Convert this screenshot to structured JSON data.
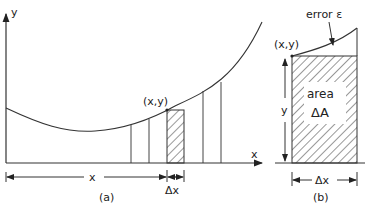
{
  "figure": {
    "panel_a": {
      "caption": "(a)",
      "axis_y_label": "y",
      "axis_x_label": "x",
      "point_label": "(x,y)",
      "width_label": "Δx",
      "distance_label": "x"
    },
    "panel_b": {
      "caption": "(b)",
      "error_label": "error ε",
      "point_label": "(x,y)",
      "height_label": "y",
      "area_label_line1": "area",
      "area_label_line2": "ΔA",
      "width_label": "Δx"
    },
    "colors": {
      "stroke": "#333333",
      "background": "#ffffff"
    }
  }
}
